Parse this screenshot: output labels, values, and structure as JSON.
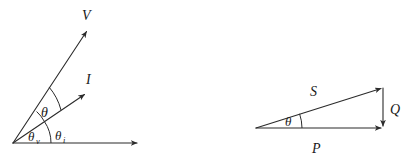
{
  "figure": {
    "title": "",
    "background_color": "#ffffff",
    "ink_color": "#2b2b2b",
    "width": 413,
    "height": 166
  },
  "left_diagram": {
    "name": "phasor-diagram",
    "origin": [
      13,
      143
    ],
    "axis": {
      "label": "",
      "from": [
        13,
        143
      ],
      "to": [
        140,
        143
      ],
      "arrow": true
    },
    "vectors": [
      {
        "key": "voltage",
        "label": "V",
        "label_pos": [
          84,
          16
        ],
        "from": [
          13,
          143
        ],
        "to": [
          88,
          29
        ],
        "arrow": true
      },
      {
        "key": "current",
        "label": "I",
        "label_pos": [
          88,
          80
        ],
        "from": [
          13,
          143
        ],
        "to": [
          86,
          93
        ],
        "arrow": true
      }
    ],
    "angles": [
      {
        "key": "theta",
        "label": "θ",
        "subscript": "",
        "label_pos": [
          46,
          112
        ],
        "arc_radius": 58,
        "between": [
          "current",
          "voltage"
        ]
      },
      {
        "key": "theta_v",
        "label": "θ",
        "subscript": "v",
        "label_pos": [
          35,
          136
        ],
        "arc_radius": 38,
        "between": [
          "axis",
          "voltage"
        ]
      },
      {
        "key": "theta_i",
        "label": "θ",
        "subscript": "i",
        "label_pos": [
          62,
          135
        ],
        "arc_radius": 38,
        "between": [
          "axis",
          "current"
        ]
      }
    ]
  },
  "right_diagram": {
    "name": "power-triangle",
    "vertex": [
      256,
      128
    ],
    "sides": [
      {
        "key": "apparent_power",
        "label": "S",
        "label_pos": [
          314,
          92
        ],
        "from": [
          256,
          128
        ],
        "to": [
          383,
          88
        ],
        "arrow": true
      },
      {
        "key": "real_power",
        "label": "P",
        "label_pos": [
          314,
          150
        ],
        "from": [
          256,
          128
        ],
        "to": [
          383,
          128
        ],
        "arrow": true
      },
      {
        "key": "reactive_power",
        "label": "Q",
        "label_pos": [
          392,
          114
        ],
        "from": [
          383,
          88
        ],
        "to": [
          383,
          128
        ],
        "arrow": true
      }
    ],
    "angles": [
      {
        "key": "theta",
        "label": "θ",
        "subscript": "",
        "label_pos": [
          278,
          125
        ],
        "arc_radius": 46,
        "between": [
          "real_power",
          "apparent_power"
        ]
      }
    ]
  }
}
